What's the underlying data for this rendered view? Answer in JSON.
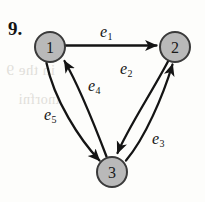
{
  "figure": {
    "item_number": "9.",
    "type": "directed-graph",
    "caption": "",
    "background_color": "#fdfdfb",
    "ink_color": "#141414",
    "node_fill_color": "#b9b9b9",
    "node_stroke_color": "#3a3a3a"
  },
  "nodes": [
    {
      "id": "1",
      "label": "1",
      "cx": 50,
      "cy": 47,
      "r": 15
    },
    {
      "id": "2",
      "label": "2",
      "cx": 175,
      "cy": 47,
      "r": 15
    },
    {
      "id": "3",
      "label": "3",
      "cx": 112,
      "cy": 172,
      "r": 15
    }
  ],
  "edges": [
    {
      "id": "e1",
      "label": "e",
      "subscript": "1",
      "from": "1",
      "to": "2",
      "shape": "straight",
      "label_x": 100,
      "label_y": 24
    },
    {
      "id": "e2",
      "label": "e",
      "subscript": "2",
      "from": "2",
      "to": "3",
      "shape": "curved",
      "label_x": 120,
      "label_y": 61
    },
    {
      "id": "e3",
      "label": "e",
      "subscript": "3",
      "from": "3",
      "to": "2",
      "shape": "curved",
      "label_x": 152,
      "label_y": 131
    },
    {
      "id": "e4",
      "label": "e",
      "subscript": "4",
      "from": "3",
      "to": "1",
      "shape": "curved",
      "label_x": 88,
      "label_y": 78
    },
    {
      "id": "e5",
      "label": "e",
      "subscript": "5",
      "from": "1",
      "to": "3",
      "shape": "curved",
      "label_x": 44,
      "label_y": 107
    }
  ],
  "bleed_text": [
    {
      "text": "in the  9",
      "x": 6,
      "y": 62,
      "size": 15
    },
    {
      "text": "tnorfni",
      "x": 18,
      "y": 92,
      "size": 14
    }
  ]
}
